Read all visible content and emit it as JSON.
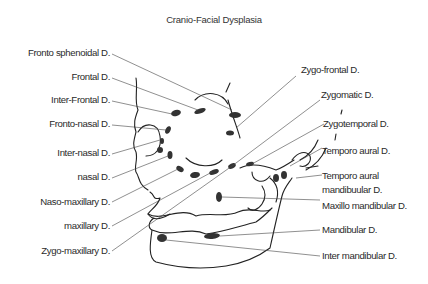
{
  "title": "Cranio-Facial Dysplasia",
  "labels_left": [
    {
      "text": "Fronto sphenoidal D."
    },
    {
      "text": "Frontal D."
    },
    {
      "text": "Inter-Frontal D."
    },
    {
      "text": "Fronto-nasal D."
    },
    {
      "text": "Inter-nasal D."
    },
    {
      "text": "nasal D."
    },
    {
      "text": "Naso-maxillary D."
    },
    {
      "text": "maxillary D."
    },
    {
      "text": "Zygo-maxillary D."
    }
  ],
  "labels_right": [
    {
      "text": "Zygo-frontal D."
    },
    {
      "text": "Zygomatic D."
    },
    {
      "text": "Zygotemporal D."
    },
    {
      "text": "Temporo aural D."
    },
    {
      "text": "Temporo aural"
    },
    {
      "text": "mandibuular D."
    },
    {
      "text": "Maxillo mandibular D."
    },
    {
      "text": "Mandibular D."
    },
    {
      "text": "Inter mandibular D."
    }
  ],
  "colors": {
    "background": "#ffffff",
    "ink": "#222222",
    "lesion": "#333333"
  }
}
